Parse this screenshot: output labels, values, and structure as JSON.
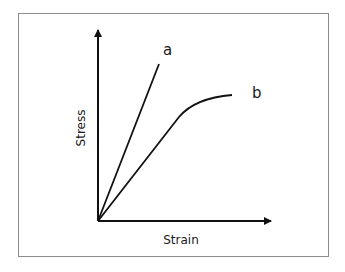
{
  "diagram": {
    "type": "stress-strain",
    "x_axis_label": "Strain",
    "y_axis_label": "Stress",
    "curves": [
      {
        "label": "a",
        "shape": "linear",
        "description": "steep straight line from origin"
      },
      {
        "label": "b",
        "shape": "linear-then-plateau",
        "description": "straight line from origin bending to level off"
      }
    ],
    "colors": {
      "line": "#111111",
      "frame": "#8c8c8c",
      "background": "#ffffff"
    }
  }
}
